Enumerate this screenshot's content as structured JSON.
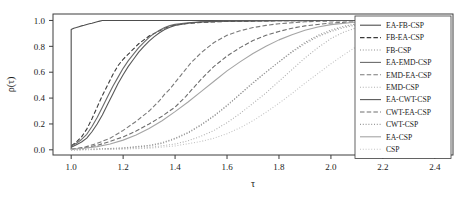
{
  "chart_data": {
    "type": "line",
    "title": "",
    "subtitle": "",
    "xlabel": "τ",
    "ylabel": "ρ(τ)",
    "xlim": [
      0.93,
      2.47
    ],
    "ylim": [
      -0.04,
      1.05
    ],
    "grid": false,
    "legend_position": "right-inside",
    "x_ticks": [
      "1.0",
      "1.2",
      "1.4",
      "1.6",
      "1.8",
      "2.0",
      "2.2",
      "2.4"
    ],
    "x_tick_values": [
      1.0,
      1.2,
      1.4,
      1.6,
      1.8,
      2.0,
      2.2,
      2.4
    ],
    "y_ticks": [
      "0.0",
      "0.2",
      "0.4",
      "0.6",
      "0.8",
      "1.0"
    ],
    "y_tick_values": [
      0.0,
      0.2,
      0.4,
      0.6,
      0.8,
      1.0
    ],
    "series": [
      {
        "name": "EA-FB-CSP",
        "style": "solid",
        "color": "#4d4d4d",
        "width": 1.1,
        "x": [
          1.0,
          1.0,
          1.01,
          1.02,
          1.03,
          1.04,
          1.05,
          1.06,
          1.07,
          1.08,
          1.09,
          1.1,
          1.11,
          1.12,
          1.15,
          1.2,
          1.4,
          1.8,
          2.4
        ],
        "y": [
          0.0,
          0.93,
          0.94,
          0.945,
          0.952,
          0.958,
          0.963,
          0.969,
          0.974,
          0.979,
          0.985,
          0.99,
          0.995,
          1.0,
          1.0,
          1.0,
          1.0,
          1.0,
          1.0
        ]
      },
      {
        "name": "FB-EA-CSP",
        "style": "dashed",
        "color": "#3a3a3a",
        "width": 1.1,
        "x": [
          1.0,
          1.02,
          1.04,
          1.06,
          1.08,
          1.1,
          1.12,
          1.14,
          1.16,
          1.18,
          1.2,
          1.22,
          1.24,
          1.26,
          1.28,
          1.3,
          1.32,
          1.34,
          1.36,
          1.38,
          1.4,
          1.44,
          1.5,
          1.6,
          1.8,
          2.0,
          2.4
        ],
        "y": [
          0.03,
          0.06,
          0.1,
          0.16,
          0.24,
          0.33,
          0.42,
          0.5,
          0.58,
          0.65,
          0.7,
          0.74,
          0.78,
          0.82,
          0.85,
          0.88,
          0.9,
          0.92,
          0.94,
          0.955,
          0.965,
          0.975,
          0.985,
          0.993,
          0.998,
          1.0,
          1.0
        ]
      },
      {
        "name": "FB-CSP",
        "style": "dotted",
        "color": "#8f8f8f",
        "width": 1.1,
        "x": [
          1.0,
          1.1,
          1.2,
          1.3,
          1.35,
          1.4,
          1.45,
          1.5,
          1.55,
          1.6,
          1.65,
          1.7,
          1.75,
          1.8,
          1.85,
          1.9,
          1.95,
          2.0,
          2.05,
          2.1,
          2.15,
          2.2,
          2.3,
          2.4
        ],
        "y": [
          0.0,
          0.005,
          0.012,
          0.03,
          0.05,
          0.085,
          0.13,
          0.19,
          0.26,
          0.34,
          0.43,
          0.52,
          0.6,
          0.68,
          0.76,
          0.83,
          0.885,
          0.925,
          0.955,
          0.975,
          0.985,
          0.992,
          0.997,
          1.0
        ]
      },
      {
        "name": "EA-EMD-CSP",
        "style": "solid",
        "color": "#6b6b6b",
        "width": 1.1,
        "x": [
          1.0,
          1.02,
          1.04,
          1.06,
          1.08,
          1.1,
          1.12,
          1.14,
          1.16,
          1.18,
          1.2,
          1.22,
          1.24,
          1.26,
          1.28,
          1.3,
          1.32,
          1.34,
          1.36,
          1.38,
          1.4,
          1.45,
          1.5,
          1.6,
          1.8,
          2.0,
          2.4
        ],
        "y": [
          0.03,
          0.05,
          0.08,
          0.12,
          0.18,
          0.25,
          0.33,
          0.41,
          0.49,
          0.56,
          0.63,
          0.69,
          0.74,
          0.79,
          0.83,
          0.87,
          0.9,
          0.925,
          0.945,
          0.96,
          0.97,
          0.982,
          0.99,
          0.996,
          1.0,
          1.0,
          1.0
        ]
      },
      {
        "name": "EMD-EA-CSP",
        "style": "dashed",
        "color": "#7a7a7a",
        "width": 1.1,
        "x": [
          1.0,
          1.05,
          1.1,
          1.15,
          1.2,
          1.25,
          1.3,
          1.32,
          1.34,
          1.36,
          1.38,
          1.4,
          1.42,
          1.44,
          1.46,
          1.48,
          1.5,
          1.55,
          1.6,
          1.65,
          1.7,
          1.75,
          1.8,
          1.9,
          2.0,
          2.2,
          2.4
        ],
        "y": [
          0.005,
          0.02,
          0.05,
          0.09,
          0.15,
          0.22,
          0.3,
          0.34,
          0.38,
          0.43,
          0.47,
          0.52,
          0.57,
          0.62,
          0.67,
          0.71,
          0.75,
          0.83,
          0.885,
          0.92,
          0.945,
          0.962,
          0.975,
          0.99,
          0.996,
          1.0,
          1.0
        ]
      },
      {
        "name": "EMD-CSP",
        "style": "dotted",
        "color": "#b0b0b0",
        "width": 1.1,
        "x": [
          1.0,
          1.1,
          1.2,
          1.3,
          1.4,
          1.45,
          1.5,
          1.55,
          1.6,
          1.65,
          1.7,
          1.75,
          1.8,
          1.85,
          1.9,
          1.95,
          2.0,
          2.05,
          2.1,
          2.15,
          2.2,
          2.3,
          2.4
        ],
        "y": [
          0.0,
          0.003,
          0.008,
          0.018,
          0.045,
          0.07,
          0.105,
          0.15,
          0.21,
          0.28,
          0.36,
          0.44,
          0.53,
          0.62,
          0.71,
          0.79,
          0.86,
          0.91,
          0.945,
          0.967,
          0.98,
          0.993,
          1.0
        ]
      },
      {
        "name": "EA-CWT-CSP",
        "style": "solid",
        "color": "#595959",
        "width": 1.1,
        "x": [
          1.0,
          1.02,
          1.04,
          1.06,
          1.08,
          1.1,
          1.12,
          1.14,
          1.16,
          1.18,
          1.2,
          1.22,
          1.24,
          1.26,
          1.28,
          1.3,
          1.32,
          1.34,
          1.36,
          1.38,
          1.4,
          1.45,
          1.5,
          1.6,
          1.8,
          2.0,
          2.4
        ],
        "y": [
          0.02,
          0.04,
          0.06,
          0.09,
          0.14,
          0.2,
          0.27,
          0.35,
          0.43,
          0.51,
          0.58,
          0.645,
          0.7,
          0.755,
          0.8,
          0.84,
          0.875,
          0.905,
          0.93,
          0.948,
          0.962,
          0.978,
          0.988,
          0.995,
          0.999,
          1.0,
          1.0
        ]
      },
      {
        "name": "CWT-EA-CSP",
        "style": "dashed",
        "color": "#6e6e6e",
        "width": 1.1,
        "x": [
          1.0,
          1.05,
          1.1,
          1.15,
          1.2,
          1.25,
          1.3,
          1.35,
          1.4,
          1.42,
          1.44,
          1.46,
          1.48,
          1.5,
          1.55,
          1.6,
          1.65,
          1.7,
          1.75,
          1.8,
          1.85,
          1.9,
          2.0,
          2.1,
          2.2,
          2.4
        ],
        "y": [
          0.005,
          0.015,
          0.035,
          0.065,
          0.1,
          0.145,
          0.2,
          0.26,
          0.33,
          0.37,
          0.41,
          0.455,
          0.5,
          0.545,
          0.645,
          0.725,
          0.79,
          0.845,
          0.885,
          0.915,
          0.94,
          0.958,
          0.98,
          0.99,
          0.996,
          1.0
        ]
      },
      {
        "name": "CWT-CSP",
        "style": "dotted",
        "color": "#9a9a9a",
        "width": 1.1,
        "x": [
          1.0,
          1.1,
          1.2,
          1.3,
          1.35,
          1.4,
          1.45,
          1.5,
          1.55,
          1.6,
          1.65,
          1.7,
          1.75,
          1.8,
          1.85,
          1.9,
          1.95,
          2.0,
          2.05,
          2.1,
          2.15,
          2.2,
          2.3,
          2.4
        ],
        "y": [
          0.0,
          0.006,
          0.015,
          0.035,
          0.055,
          0.09,
          0.135,
          0.195,
          0.265,
          0.345,
          0.43,
          0.515,
          0.6,
          0.68,
          0.755,
          0.82,
          0.875,
          0.915,
          0.945,
          0.967,
          0.98,
          0.99,
          0.997,
          1.0
        ]
      },
      {
        "name": "EA-CSP",
        "style": "solid",
        "color": "#a5a5a5",
        "width": 1.1,
        "x": [
          1.0,
          1.05,
          1.1,
          1.15,
          1.2,
          1.25,
          1.3,
          1.35,
          1.4,
          1.45,
          1.5,
          1.55,
          1.6,
          1.65,
          1.7,
          1.75,
          1.8,
          1.85,
          1.9,
          1.95,
          2.0,
          2.1,
          2.2,
          2.4
        ],
        "y": [
          0.005,
          0.012,
          0.025,
          0.045,
          0.075,
          0.115,
          0.165,
          0.225,
          0.295,
          0.37,
          0.45,
          0.53,
          0.61,
          0.68,
          0.745,
          0.8,
          0.85,
          0.89,
          0.925,
          0.95,
          0.968,
          0.988,
          0.996,
          1.0
        ]
      },
      {
        "name": "CSP",
        "style": "dotted",
        "color": "#c4c4c4",
        "width": 1.1,
        "x": [
          1.0,
          1.1,
          1.2,
          1.3,
          1.4,
          1.5,
          1.55,
          1.6,
          1.65,
          1.7,
          1.75,
          1.8,
          1.85,
          1.9,
          1.95,
          2.0,
          2.05,
          2.1,
          2.15,
          2.2,
          2.25,
          2.3,
          2.35,
          2.4
        ],
        "y": [
          0.0,
          0.002,
          0.006,
          0.012,
          0.03,
          0.065,
          0.09,
          0.125,
          0.17,
          0.225,
          0.29,
          0.36,
          0.435,
          0.515,
          0.59,
          0.665,
          0.735,
          0.8,
          0.855,
          0.9,
          0.935,
          0.962,
          0.982,
          1.0
        ]
      }
    ]
  },
  "legend": {
    "entries": [
      {
        "label": "EA-FB-CSP"
      },
      {
        "label": "FB-EA-CSP"
      },
      {
        "label": "FB-CSP"
      },
      {
        "label": "EA-EMD-CSP"
      },
      {
        "label": "EMD-EA-CSP"
      },
      {
        "label": "EMD-CSP"
      },
      {
        "label": "EA-CWT-CSP"
      },
      {
        "label": "CWT-EA-CSP"
      },
      {
        "label": "CWT-CSP"
      },
      {
        "label": "EA-CSP"
      },
      {
        "label": "CSP"
      }
    ]
  },
  "axes": {
    "x_title": "τ",
    "y_title": "ρ(τ)",
    "frame_color": "#3c3c3c"
  }
}
